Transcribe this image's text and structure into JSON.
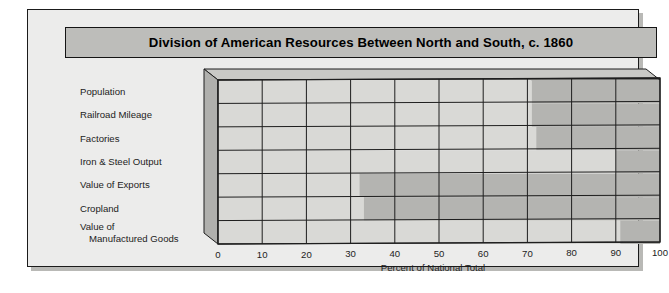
{
  "card": {
    "title": "Division of American Resources Between North and South, c. 1860"
  },
  "axis": {
    "xlabel": "Percent of National Total",
    "ticks": [
      "0",
      "10",
      "20",
      "30",
      "40",
      "50",
      "60",
      "70",
      "80",
      "90",
      "100"
    ]
  },
  "colors": {
    "title_band": "#bdbdba",
    "card_background": "#ececeb",
    "light_segment": "#d9d9d6",
    "dark_segment": "#b4b4b1",
    "side_wall": "#b0b0ad",
    "top_wall": "#c9c9c6",
    "gridline": "#1e1e1e",
    "text": "#1c1c1c"
  },
  "chart_data": {
    "type": "bar",
    "title": "Division of American Resources Between North and South, c. 1860",
    "subtitle": "",
    "xlabel": "Percent of National Total",
    "ylabel": "",
    "xlim": [
      0,
      100
    ],
    "xticks": [
      0,
      10,
      20,
      30,
      40,
      50,
      60,
      70,
      80,
      90,
      100
    ],
    "grid": true,
    "legend": "none",
    "orientation": "horizontal",
    "stacked": true,
    "categories": [
      "Population",
      "Railroad Mileage",
      "Factories",
      "Iron & Steel Output",
      "Value of Exports",
      "Cropland",
      "Value of Manufactured Goods"
    ],
    "series": [
      {
        "name": "North",
        "values": [
          71,
          71,
          72,
          90,
          32,
          33,
          91
        ]
      },
      {
        "name": "South",
        "values": [
          29,
          29,
          28,
          10,
          68,
          67,
          9
        ]
      }
    ]
  }
}
